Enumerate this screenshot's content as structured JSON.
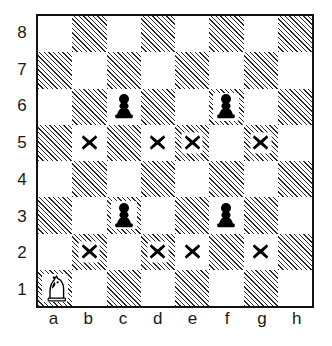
{
  "diagram": {
    "type": "chessboard",
    "board_size": 8,
    "orientation": "white-bottom",
    "colors": {
      "light_square": "#ffffff",
      "dark_square_hatch": "#2b2b2b",
      "border": "#111111",
      "piece_black": "#000000",
      "piece_white_outline": "#000000",
      "mark": "#000000",
      "label_text": "#1a1a1a",
      "page_background": "#ffffff"
    },
    "file_labels": [
      "a",
      "b",
      "c",
      "d",
      "e",
      "f",
      "g",
      "h"
    ],
    "rank_labels": [
      "8",
      "7",
      "6",
      "5",
      "4",
      "3",
      "2",
      "1"
    ],
    "pieces": [
      {
        "square": "a1",
        "piece": "knight",
        "color": "white",
        "icon": "white-knight-icon"
      },
      {
        "square": "c6",
        "piece": "pawn",
        "color": "black",
        "icon": "black-pawn-icon"
      },
      {
        "square": "f6",
        "piece": "pawn",
        "color": "black",
        "icon": "black-pawn-icon"
      },
      {
        "square": "c3",
        "piece": "pawn",
        "color": "black",
        "icon": "black-pawn-icon"
      },
      {
        "square": "f3",
        "piece": "pawn",
        "color": "black",
        "icon": "black-pawn-icon"
      }
    ],
    "marks": [
      {
        "square": "b5",
        "symbol": "x",
        "icon": "cross-mark-icon"
      },
      {
        "square": "d5",
        "symbol": "x",
        "icon": "cross-mark-icon"
      },
      {
        "square": "e5",
        "symbol": "x",
        "icon": "cross-mark-icon"
      },
      {
        "square": "g5",
        "symbol": "x",
        "icon": "cross-mark-icon"
      },
      {
        "square": "b2",
        "symbol": "x",
        "icon": "cross-mark-icon"
      },
      {
        "square": "d2",
        "symbol": "x",
        "icon": "cross-mark-icon"
      },
      {
        "square": "e2",
        "symbol": "x",
        "icon": "cross-mark-icon"
      },
      {
        "square": "g2",
        "symbol": "x",
        "icon": "cross-mark-icon"
      }
    ],
    "squares": [
      {
        "id": "a8",
        "shade": "light"
      },
      {
        "id": "b8",
        "shade": "dark"
      },
      {
        "id": "c8",
        "shade": "light"
      },
      {
        "id": "d8",
        "shade": "dark"
      },
      {
        "id": "e8",
        "shade": "light"
      },
      {
        "id": "f8",
        "shade": "dark"
      },
      {
        "id": "g8",
        "shade": "light"
      },
      {
        "id": "h8",
        "shade": "dark"
      },
      {
        "id": "a7",
        "shade": "dark"
      },
      {
        "id": "b7",
        "shade": "light"
      },
      {
        "id": "c7",
        "shade": "dark"
      },
      {
        "id": "d7",
        "shade": "light"
      },
      {
        "id": "e7",
        "shade": "dark"
      },
      {
        "id": "f7",
        "shade": "light"
      },
      {
        "id": "g7",
        "shade": "dark"
      },
      {
        "id": "h7",
        "shade": "light"
      },
      {
        "id": "a6",
        "shade": "light"
      },
      {
        "id": "b6",
        "shade": "dark"
      },
      {
        "id": "c6",
        "shade": "light"
      },
      {
        "id": "d6",
        "shade": "dark"
      },
      {
        "id": "e6",
        "shade": "light"
      },
      {
        "id": "f6",
        "shade": "dark"
      },
      {
        "id": "g6",
        "shade": "light"
      },
      {
        "id": "h6",
        "shade": "dark"
      },
      {
        "id": "a5",
        "shade": "dark"
      },
      {
        "id": "b5",
        "shade": "light"
      },
      {
        "id": "c5",
        "shade": "dark"
      },
      {
        "id": "d5",
        "shade": "light"
      },
      {
        "id": "e5",
        "shade": "dark"
      },
      {
        "id": "f5",
        "shade": "light"
      },
      {
        "id": "g5",
        "shade": "dark"
      },
      {
        "id": "h5",
        "shade": "light"
      },
      {
        "id": "a4",
        "shade": "light"
      },
      {
        "id": "b4",
        "shade": "dark"
      },
      {
        "id": "c4",
        "shade": "light"
      },
      {
        "id": "d4",
        "shade": "dark"
      },
      {
        "id": "e4",
        "shade": "light"
      },
      {
        "id": "f4",
        "shade": "dark"
      },
      {
        "id": "g4",
        "shade": "light"
      },
      {
        "id": "h4",
        "shade": "dark"
      },
      {
        "id": "a3",
        "shade": "dark"
      },
      {
        "id": "b3",
        "shade": "light"
      },
      {
        "id": "c3",
        "shade": "dark"
      },
      {
        "id": "d3",
        "shade": "light"
      },
      {
        "id": "e3",
        "shade": "dark"
      },
      {
        "id": "f3",
        "shade": "light"
      },
      {
        "id": "g3",
        "shade": "dark"
      },
      {
        "id": "h3",
        "shade": "light"
      },
      {
        "id": "a2",
        "shade": "light"
      },
      {
        "id": "b2",
        "shade": "dark"
      },
      {
        "id": "c2",
        "shade": "light"
      },
      {
        "id": "d2",
        "shade": "dark"
      },
      {
        "id": "e2",
        "shade": "light"
      },
      {
        "id": "f2",
        "shade": "dark"
      },
      {
        "id": "g2",
        "shade": "light"
      },
      {
        "id": "h2",
        "shade": "dark"
      },
      {
        "id": "a1",
        "shade": "dark"
      },
      {
        "id": "b1",
        "shade": "light"
      },
      {
        "id": "c1",
        "shade": "dark"
      },
      {
        "id": "d1",
        "shade": "light"
      },
      {
        "id": "e1",
        "shade": "dark"
      },
      {
        "id": "f1",
        "shade": "light"
      },
      {
        "id": "g1",
        "shade": "dark"
      },
      {
        "id": "h1",
        "shade": "light"
      }
    ]
  }
}
